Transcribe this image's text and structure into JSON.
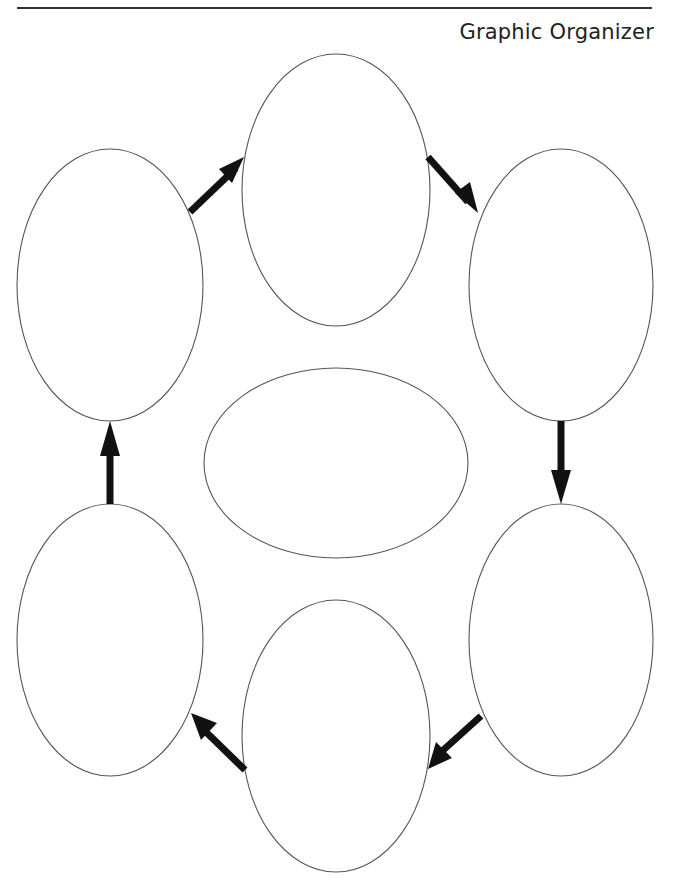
{
  "header": {
    "title": "Graphic Organizer"
  },
  "diagram": {
    "type": "cycle",
    "center_node": {
      "id": "center",
      "label": ""
    },
    "nodes": [
      {
        "id": "top",
        "label": ""
      },
      {
        "id": "upper-right",
        "label": ""
      },
      {
        "id": "lower-right",
        "label": ""
      },
      {
        "id": "bottom",
        "label": ""
      },
      {
        "id": "lower-left",
        "label": ""
      },
      {
        "id": "upper-left",
        "label": ""
      }
    ],
    "edges": [
      {
        "from": "upper-left",
        "to": "top"
      },
      {
        "from": "top",
        "to": "upper-right"
      },
      {
        "from": "upper-right",
        "to": "lower-right"
      },
      {
        "from": "lower-right",
        "to": "bottom"
      },
      {
        "from": "bottom",
        "to": "lower-left"
      },
      {
        "from": "lower-left",
        "to": "upper-left"
      }
    ],
    "colors": {
      "outline": "#555555",
      "arrow": "#111111",
      "background": "#ffffff"
    }
  }
}
